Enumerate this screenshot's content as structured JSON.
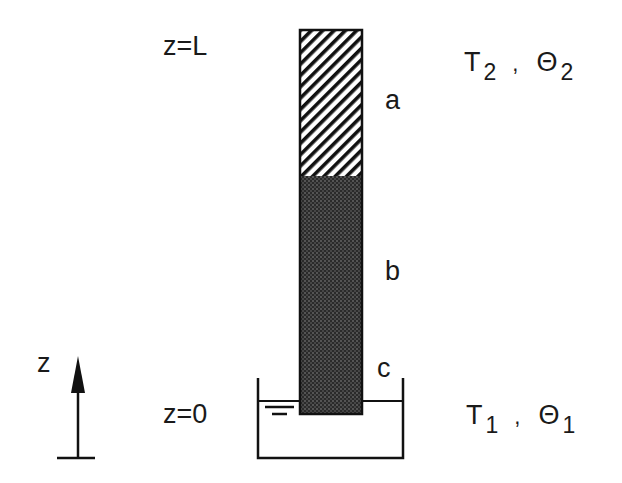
{
  "diagram": {
    "labels": {
      "top_boundary": "z=L",
      "bottom_boundary": "z=0",
      "axis": "z",
      "layer_a": "a",
      "layer_b": "b",
      "layer_c": "c"
    },
    "top_conditions": {
      "temperature": "T",
      "temperature_sub": "2",
      "separator": ",",
      "moisture": "Θ",
      "moisture_sub": "2"
    },
    "bottom_conditions": {
      "temperature": "T",
      "temperature_sub": "1",
      "separator": ",",
      "moisture": "Θ",
      "moisture_sub": "1"
    },
    "colors": {
      "stroke": "#111111",
      "background": "#ffffff"
    }
  }
}
